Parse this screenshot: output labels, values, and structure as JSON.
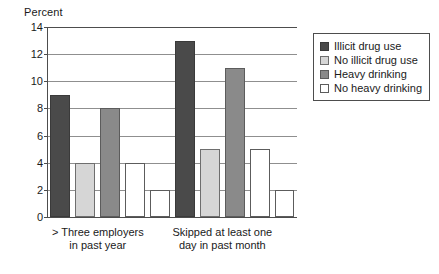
{
  "chart_data": {
    "type": "bar",
    "title": "",
    "ylabel": "Percent",
    "xlabel": "",
    "ylim": [
      0,
      14
    ],
    "yticks": [
      0,
      2,
      4,
      6,
      8,
      10,
      12,
      14
    ],
    "grid": true,
    "legend_position": "right",
    "categories": [
      "> Three employers in past year",
      "Skipped at least one day in past month"
    ],
    "category_lines": [
      [
        "> Three employers",
        "in past year"
      ],
      [
        "Skipped at least one",
        "day in past month"
      ]
    ],
    "series": [
      {
        "name": "Illicit drug use",
        "color": "#4a4a4a",
        "values": [
          9,
          13
        ]
      },
      {
        "name": "No illicit drug use",
        "color": "#d6d6d6",
        "values": [
          4,
          5
        ]
      },
      {
        "name": "Heavy drinking",
        "color": "#8a8a8a",
        "values": [
          8,
          11
        ]
      },
      {
        "name": "No heavy drinking",
        "color": "#ffffff",
        "values": [
          4,
          5
        ]
      }
    ],
    "trailing_bars": [
      {
        "series": "No heavy drinking",
        "color": "#ffffff",
        "value": 2
      },
      {
        "series": "No heavy drinking",
        "color": "#ffffff",
        "value": 2
      }
    ]
  },
  "legend": {
    "items": [
      {
        "label": "Illicit drug use",
        "swatch": "dark-gray-swatch"
      },
      {
        "label": "No illicit drug use",
        "swatch": "light-gray-swatch"
      },
      {
        "label": "Heavy drinking",
        "swatch": "medium-gray-swatch"
      },
      {
        "label": "No heavy drinking",
        "swatch": "white-swatch"
      }
    ]
  }
}
